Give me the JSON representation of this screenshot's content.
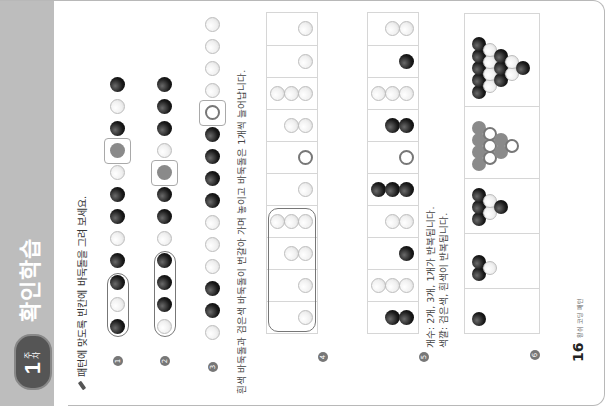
{
  "header": {
    "week_badge": {
      "number": "1",
      "label": "주차"
    },
    "title": "확인학습"
  },
  "instruction": "패턴에 맞도록 빈칸에 바둑돌을 그려 보세요.",
  "problems": [
    {
      "number": "1",
      "sequence": [
        "b",
        "w",
        "b",
        "b",
        "w",
        "b",
        "b",
        "w",
        "g",
        "b",
        "w",
        "b"
      ],
      "pattern_group": [
        0,
        2
      ],
      "answer_slot": 8
    },
    {
      "number": "2",
      "sequence": [
        "w",
        "b",
        "b",
        "b",
        "w",
        "b",
        "b",
        "g",
        "w",
        "b",
        "b",
        "b"
      ],
      "pattern_group": [
        0,
        3
      ],
      "answer_slot": 7
    },
    {
      "number": "3",
      "sequence": [
        "w",
        "b",
        "b",
        "w",
        "w",
        "w",
        "b",
        "b",
        "b",
        "b",
        "o",
        "w",
        "w",
        "w",
        "w"
      ],
      "answer_slot": 10,
      "note": "흰색 바둑돌과 검은색 바둑돌이 번갈아 가며 놓이고 바둑돌은 1개씩 늘어납니다."
    },
    {
      "number": "4",
      "cells": [
        {
          "count": 1,
          "color": "w"
        },
        {
          "count": 1,
          "color": "w"
        },
        {
          "count": 2,
          "color": "w"
        },
        {
          "count": 3,
          "color": "w"
        },
        {
          "count": 1,
          "color": "w"
        },
        {
          "count": 1,
          "color": "o"
        },
        {
          "count": 2,
          "color": "w"
        },
        {
          "count": 3,
          "color": "w"
        },
        {
          "count": 1,
          "color": "w"
        },
        {
          "count": 1,
          "color": "w"
        }
      ],
      "pattern_group": [
        0,
        3
      ]
    },
    {
      "number": "5",
      "cells": [
        {
          "count": 2,
          "color": "b"
        },
        {
          "count": 3,
          "color": "w"
        },
        {
          "count": 1,
          "color": "b"
        },
        {
          "count": 2,
          "color": "w"
        },
        {
          "count": 3,
          "color": "b"
        },
        {
          "count": 1,
          "color": "o"
        },
        {
          "count": 2,
          "color": "b"
        },
        {
          "count": 3,
          "color": "w"
        },
        {
          "count": 1,
          "color": "b"
        },
        {
          "count": 2,
          "color": "w"
        }
      ],
      "note_lines": [
        "개수: 2개, 3개, 1개가 반복됩니다.",
        "색깔: 검은색, 흰색이 반복됩니다."
      ]
    },
    {
      "number": "6",
      "figures": [
        {
          "stones": [
            {
              "c": "b",
              "col": 0,
              "row": 0
            }
          ]
        },
        {
          "stones": [
            {
              "c": "b",
              "col": 0,
              "row": 0
            },
            {
              "c": "b",
              "col": 0,
              "row": 1
            },
            {
              "c": "w",
              "col": 1,
              "row": 0.5
            }
          ]
        },
        {
          "stones": [
            {
              "c": "b",
              "col": 0,
              "row": 0
            },
            {
              "c": "b",
              "col": 0,
              "row": 1
            },
            {
              "c": "b",
              "col": 0,
              "row": 2
            },
            {
              "c": "w",
              "col": 1,
              "row": 0.5
            },
            {
              "c": "w",
              "col": 1,
              "row": 1.5
            },
            {
              "c": "b",
              "col": 2,
              "row": 1
            }
          ]
        },
        {
          "stones": [
            {
              "c": "g",
              "col": 0,
              "row": 0
            },
            {
              "c": "g",
              "col": 0,
              "row": 1
            },
            {
              "c": "g",
              "col": 0,
              "row": 2
            },
            {
              "c": "g",
              "col": 0,
              "row": 3
            },
            {
              "c": "o",
              "col": 1,
              "row": 0.5
            },
            {
              "c": "o",
              "col": 1,
              "row": 1.5
            },
            {
              "c": "o",
              "col": 1,
              "row": 2.5
            },
            {
              "c": "g",
              "col": 2,
              "row": 1
            },
            {
              "c": "g",
              "col": 2,
              "row": 2
            },
            {
              "c": "o",
              "col": 3,
              "row": 1.5
            }
          ]
        },
        {
          "stones": [
            {
              "c": "b",
              "col": 0,
              "row": 0
            },
            {
              "c": "b",
              "col": 0,
              "row": 1
            },
            {
              "c": "b",
              "col": 0,
              "row": 2
            },
            {
              "c": "b",
              "col": 0,
              "row": 3
            },
            {
              "c": "b",
              "col": 0,
              "row": 4
            },
            {
              "c": "w",
              "col": 1,
              "row": 0.5
            },
            {
              "c": "w",
              "col": 1,
              "row": 1.5
            },
            {
              "c": "w",
              "col": 1,
              "row": 2.5
            },
            {
              "c": "w",
              "col": 1,
              "row": 3.5
            },
            {
              "c": "b",
              "col": 2,
              "row": 1
            },
            {
              "c": "b",
              "col": 2,
              "row": 2
            },
            {
              "c": "b",
              "col": 2,
              "row": 3
            },
            {
              "c": "w",
              "col": 3,
              "row": 1.5
            },
            {
              "c": "w",
              "col": 3,
              "row": 2.5
            },
            {
              "c": "b",
              "col": 4,
              "row": 2
            }
          ]
        }
      ]
    }
  ],
  "footer": {
    "page_number": "16",
    "label": "왕쉬 코딩 패턴"
  },
  "colors": {
    "banner": "#bdbdbd",
    "badge": "#555555",
    "stone_black": "#111111",
    "stone_white": "#f4f4f4",
    "answer_gray": "#8a8a8a"
  }
}
